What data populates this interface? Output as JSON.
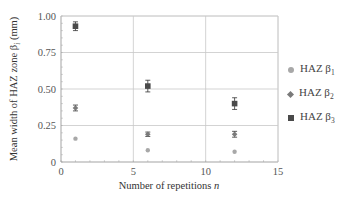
{
  "chart_data": {
    "type": "scatter",
    "title": "",
    "xlabel": "Number of repetitions n",
    "xlabel_text": "Number of repetitions ",
    "xlabel_var": "n",
    "ylabel": "Mean width of HAZ zone βi (mm)",
    "ylabel_prefix": "Mean width of HAZ zone β",
    "ylabel_sub": "i",
    "ylabel_suffix": " (mm)",
    "xlim": [
      0,
      15
    ],
    "ylim": [
      0,
      1.0
    ],
    "x_ticks": [
      "0",
      "5",
      "10",
      "15"
    ],
    "y_ticks": [
      "0",
      "0.25",
      "0.50",
      "0.75",
      "1.00"
    ],
    "grid": true,
    "legend_position": "right",
    "x": [
      1,
      6,
      12
    ],
    "series": [
      {
        "name": "HAZ β1",
        "label": "HAZ β",
        "sub": "1",
        "marker": "circle",
        "color": "#a8a8a8",
        "values": [
          0.16,
          0.08,
          0.07
        ],
        "errors": [
          0.005,
          0.005,
          0.005
        ]
      },
      {
        "name": "HAZ β2",
        "label": "HAZ β",
        "sub": "2",
        "marker": "diamond",
        "color": "#7a7a7a",
        "values": [
          0.37,
          0.19,
          0.19
        ],
        "errors": [
          0.02,
          0.015,
          0.02
        ]
      },
      {
        "name": "HAZ β3",
        "label": "HAZ β",
        "sub": "3",
        "marker": "square",
        "color": "#4a4a4a",
        "values": [
          0.93,
          0.52,
          0.4
        ],
        "errors": [
          0.03,
          0.04,
          0.04
        ]
      }
    ]
  }
}
